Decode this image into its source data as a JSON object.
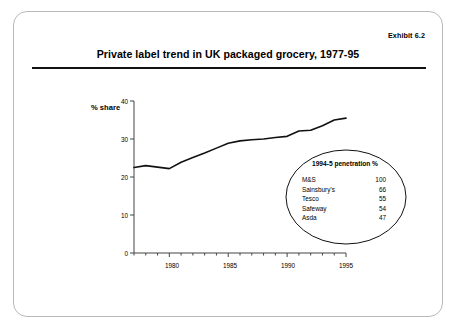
{
  "exhibit": {
    "label": "Exhibit 6.2"
  },
  "title": "Private label trend in UK packaged grocery, 1977-95",
  "inset": {
    "heading": "1994-5 penetration %",
    "rows": [
      {
        "name": "M&S",
        "value": "100"
      },
      {
        "name": "Sainsbury's",
        "value": "66"
      },
      {
        "name": "Tesco",
        "value": "55"
      },
      {
        "name": "Safeway",
        "value": "54"
      },
      {
        "name": "Asda",
        "value": "47"
      }
    ]
  },
  "chart_data": {
    "type": "line",
    "title": "Private label trend in UK packaged grocery, 1977-95",
    "xlabel": "",
    "ylabel": "% share",
    "ylim": [
      0,
      40
    ],
    "xlim": [
      1977,
      1995
    ],
    "yticks": [
      "0",
      "10",
      "20",
      "30",
      "40"
    ],
    "ytick_values": [
      0,
      10,
      20,
      30,
      40
    ],
    "xticks": [
      "1980",
      "1985",
      "1990",
      "1995"
    ],
    "xtick_values": [
      1980,
      1985,
      1990,
      1995
    ],
    "grid": false,
    "legend": "none",
    "series": [
      {
        "name": "Private label share",
        "x": [
          1977,
          1978,
          1979,
          1980,
          1981,
          1982,
          1983,
          1984,
          1985,
          1986,
          1987,
          1988,
          1989,
          1990,
          1991,
          1992,
          1993,
          1994,
          1995
        ],
        "values": [
          22.5,
          23.0,
          22.6,
          22.2,
          23.9,
          25.1,
          26.3,
          27.6,
          28.9,
          29.5,
          29.8,
          30.0,
          30.4,
          30.7,
          32.1,
          32.3,
          33.5,
          35.0,
          35.5
        ]
      }
    ]
  },
  "colors": {
    "line": "#111111",
    "axis": "#444444",
    "card_border": "#b9b9b9",
    "text": "#000000"
  }
}
